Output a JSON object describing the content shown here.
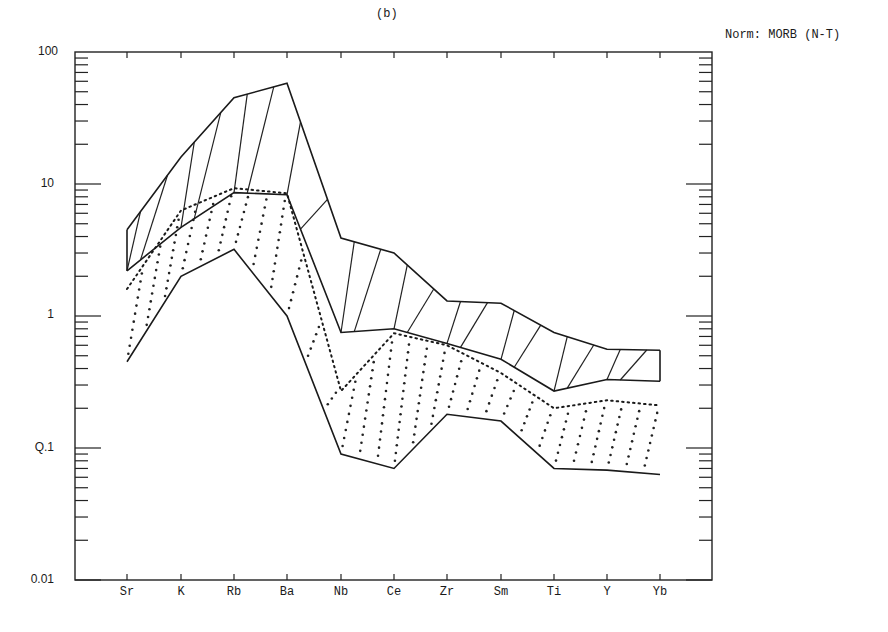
{
  "chart_data": {
    "type": "line",
    "title": "(b)",
    "annotation": "Norm: MORB (N-T)",
    "xlabel": "",
    "ylabel": "",
    "yscale": "log",
    "ylim": [
      0.01,
      100
    ],
    "y_ticks": [
      "100",
      "10",
      "1",
      "Q.1",
      "0.01"
    ],
    "y_tick_values": [
      100,
      10,
      1,
      0.1,
      0.01
    ],
    "categories": [
      "Sr",
      "K",
      "Rb",
      "Ba",
      "Nb",
      "Ce",
      "Zr",
      "Sm",
      "Ti",
      "Y",
      "Yb"
    ],
    "grid": false,
    "legend": null,
    "series": [
      {
        "name": "Envelope A upper",
        "style": "solid",
        "values": [
          4.5,
          16,
          45,
          58,
          3.9,
          3.0,
          1.3,
          1.25,
          0.75,
          0.56,
          0.55
        ]
      },
      {
        "name": "Envelope A lower",
        "style": "solid",
        "values": [
          2.2,
          4.7,
          8.6,
          8.3,
          0.75,
          0.8,
          0.62,
          0.47,
          0.27,
          0.33,
          0.32
        ]
      },
      {
        "name": "Envelope B upper",
        "style": "dotted",
        "values": [
          1.6,
          6.3,
          9.3,
          8.5,
          0.27,
          0.74,
          0.6,
          0.37,
          0.2,
          0.23,
          0.21
        ]
      },
      {
        "name": "Envelope B lower",
        "style": "solid",
        "values": [
          0.45,
          2.0,
          3.2,
          1.0,
          0.09,
          0.07,
          0.18,
          0.16,
          0.07,
          0.068,
          0.063
        ]
      }
    ]
  },
  "labels": {
    "panel": "(b)",
    "norm": "Norm: MORB (N-T)",
    "y": [
      "100",
      "10",
      "1",
      "Q.1",
      "0.01"
    ],
    "x": [
      "Sr",
      "K",
      "Rb",
      "Ba",
      "Nb",
      "Ce",
      "Zr",
      "Sm",
      "Ti",
      "Y",
      "Yb"
    ]
  }
}
